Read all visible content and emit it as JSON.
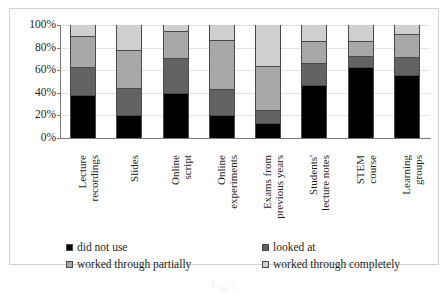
{
  "chart_data": {
    "type": "bar",
    "subtype": "stacked-100-percent",
    "title": "",
    "xlabel": "",
    "ylabel": "",
    "ylim": [
      0,
      100
    ],
    "ytick_labels": [
      "100%",
      "80%",
      "60%",
      "40%",
      "20%",
      "0%"
    ],
    "ytick_values": [
      100,
      80,
      60,
      40,
      20,
      0
    ],
    "grid": true,
    "legend_position": "bottom",
    "categories": [
      "Lecture recordings",
      "Slides",
      "Online script",
      "Online experiments",
      "Exams from previous years",
      "Students' lecture notes",
      "STEM course",
      "Learning groups"
    ],
    "category_lines": [
      [
        "Lecture",
        "recordings"
      ],
      [
        "Slides"
      ],
      [
        "Online",
        "script"
      ],
      [
        "Online",
        "experiments"
      ],
      [
        "Exams from",
        "previous years"
      ],
      [
        "Students'",
        "lecture notes"
      ],
      [
        "STEM",
        "course"
      ],
      [
        "Learning",
        "groups"
      ]
    ],
    "series": [
      {
        "name": "did not use",
        "color": "#000000",
        "values": [
          38,
          20,
          40,
          20,
          13,
          47,
          63,
          56
        ]
      },
      {
        "name": "looked at",
        "color": "#636363",
        "values": [
          25,
          24,
          31,
          23,
          12,
          19,
          10,
          16
        ]
      },
      {
        "name": "worked through partially",
        "color": "#a8a8a8",
        "values": [
          27,
          34,
          24,
          44,
          39,
          20,
          13,
          20
        ]
      },
      {
        "name": "worked through completely",
        "color": "#cfcfcf",
        "values": [
          10,
          22,
          5,
          13,
          36,
          14,
          14,
          8
        ]
      }
    ],
    "cumulative": [
      [
        38,
        63,
        90,
        100
      ],
      [
        20,
        44,
        78,
        100
      ],
      [
        40,
        71,
        95,
        100
      ],
      [
        20,
        43,
        87,
        100
      ],
      [
        13,
        25,
        64,
        100
      ],
      [
        47,
        66,
        86,
        100
      ],
      [
        63,
        73,
        86,
        100
      ],
      [
        56,
        72,
        92,
        100
      ]
    ]
  },
  "legend": {
    "items": [
      {
        "label": "did not use",
        "color": "#000000"
      },
      {
        "label": "looked at",
        "color": "#636363"
      },
      {
        "label": "worked through partially",
        "color": "#a8a8a8"
      },
      {
        "label": "worked through completely",
        "color": "#cfcfcf"
      }
    ]
  },
  "caption": {
    "text": "Fig. 1"
  }
}
